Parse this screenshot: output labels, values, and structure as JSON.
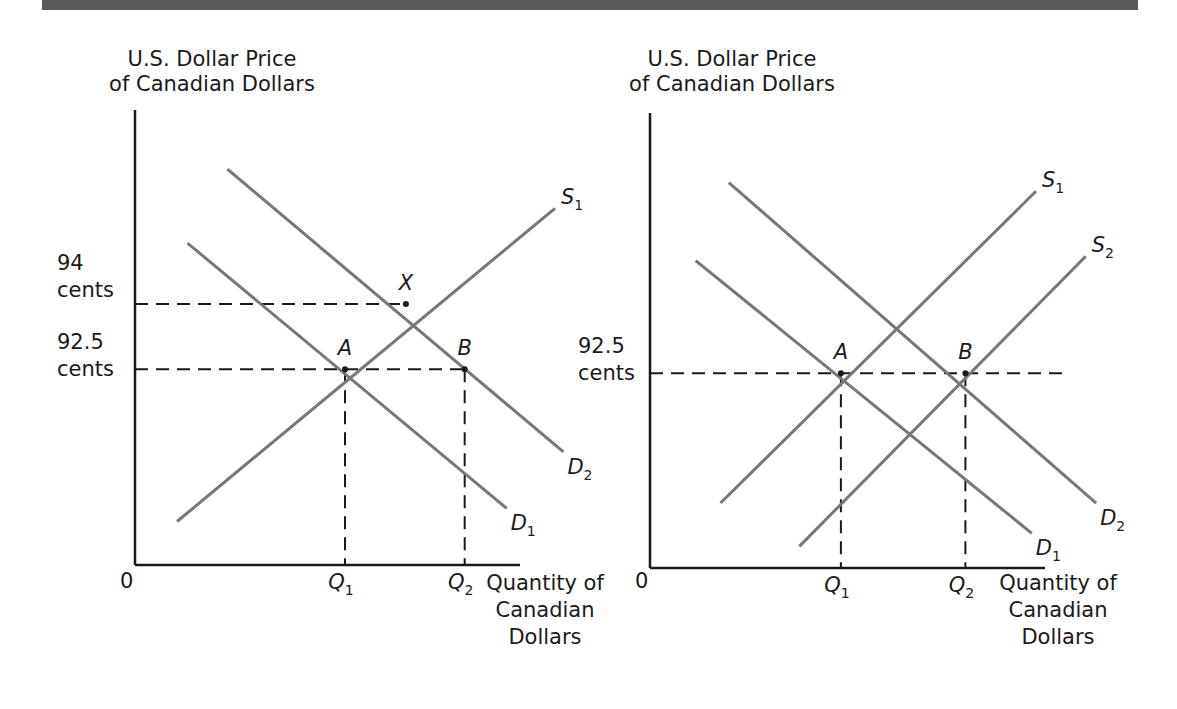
{
  "header_band": {
    "color": "#5a5a5a"
  },
  "chart_data": [
    {
      "type": "line",
      "title": "",
      "ylabel_lines": [
        "U.S. Dollar Price",
        "of Canadian Dollars"
      ],
      "xlabel_lines": [
        "Quantity of",
        "Canadian",
        "Dollars"
      ],
      "origin_label": "0",
      "y_ticks": [
        {
          "value": 94,
          "label_lines": [
            "94",
            "cents"
          ]
        },
        {
          "value": 92.5,
          "label_lines": [
            "92.5",
            "cents"
          ]
        }
      ],
      "x_ticks": [
        {
          "key": "Q1",
          "label": "Q",
          "sub": "1"
        },
        {
          "key": "Q2",
          "label": "Q",
          "sub": "2"
        }
      ],
      "x_range": [
        0,
        10
      ],
      "y_range": [
        88,
        98
      ],
      "series": [
        {
          "name": "S1",
          "label": "S",
          "sub": "1",
          "kind": "supply",
          "points": [
            [
              1,
              89
            ],
            [
              10,
              96.2
            ]
          ]
        },
        {
          "name": "D1",
          "label": "D",
          "sub": "1",
          "kind": "demand",
          "points": [
            [
              1.25,
              95.4
            ],
            [
              8.85,
              89.3
            ]
          ]
        },
        {
          "name": "D2",
          "label": "D",
          "sub": "2",
          "kind": "demand",
          "points": [
            [
              2.2,
              97.1
            ],
            [
              10.2,
              90.6
            ]
          ]
        }
      ],
      "points": [
        {
          "name": "X",
          "x": 6.45,
          "y": 94
        },
        {
          "name": "A",
          "x": 5,
          "y": 92.5
        },
        {
          "name": "B",
          "x": 7.85,
          "y": 92.5
        }
      ],
      "guides": [
        {
          "from": "axis",
          "y": 94,
          "to_x": 6.45
        },
        {
          "from": "axis",
          "y": 92.5,
          "to_x": 7.85
        },
        {
          "vertical": true,
          "x": 5,
          "y": 92.5
        },
        {
          "vertical": true,
          "x": 7.85,
          "y": 92.5
        }
      ],
      "line_color": "#777777",
      "axis_color": "#1a1a1a"
    },
    {
      "type": "line",
      "title": "",
      "ylabel_lines": [
        "U.S. Dollar Price",
        "of Canadian Dollars"
      ],
      "xlabel_lines": [
        "Quantity of",
        "Canadian",
        "Dollars"
      ],
      "origin_label": "0",
      "y_ticks": [
        {
          "value": 92.5,
          "label_lines": [
            "92.5",
            "cents"
          ]
        }
      ],
      "x_ticks": [
        {
          "key": "Q1",
          "label": "Q",
          "sub": "1"
        },
        {
          "key": "Q2",
          "label": "Q",
          "sub": "2"
        }
      ],
      "x_range": [
        0,
        10
      ],
      "y_range": [
        88,
        98
      ],
      "series": [
        {
          "name": "S1",
          "label": "S",
          "sub": "1",
          "kind": "supply",
          "points": [
            [
              1.7,
              89.5
            ],
            [
              9.3,
              96.7
            ]
          ]
        },
        {
          "name": "S2",
          "label": "S",
          "sub": "2",
          "kind": "supply",
          "points": [
            [
              3.6,
              88.5
            ],
            [
              10.5,
              95.2
            ]
          ]
        },
        {
          "name": "D1",
          "label": "D",
          "sub": "1",
          "kind": "demand",
          "points": [
            [
              1.1,
              95.1
            ],
            [
              9.2,
              88.8
            ]
          ]
        },
        {
          "name": "D2",
          "label": "D",
          "sub": "2",
          "kind": "demand",
          "points": [
            [
              1.9,
              96.9
            ],
            [
              10.75,
              89.5
            ]
          ]
        }
      ],
      "points": [
        {
          "name": "A",
          "x": 4.6,
          "y": 92.5
        },
        {
          "name": "B",
          "x": 7.6,
          "y": 92.5
        }
      ],
      "guides": [
        {
          "from": "axis",
          "y": 92.5,
          "to_x": 10
        },
        {
          "vertical": true,
          "x": 4.6,
          "y": 92.5
        },
        {
          "vertical": true,
          "x": 7.6,
          "y": 92.5
        }
      ],
      "line_color": "#777777",
      "axis_color": "#1a1a1a"
    }
  ]
}
